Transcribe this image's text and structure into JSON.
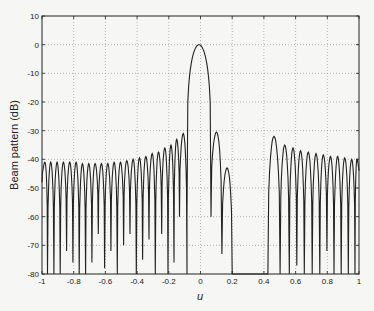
{
  "chart_data": {
    "type": "line",
    "title": "",
    "xlabel": "u",
    "ylabel": "Beam pattern (dB)",
    "xlim": [
      -1,
      1
    ],
    "ylim": [
      -80,
      10
    ],
    "grid": true,
    "legend": null,
    "x_ticks": [
      "-1",
      "-0.8",
      "-0.6",
      "-0.4",
      "-0.2",
      "0",
      "0.2",
      "0.4",
      "0.6",
      "0.8",
      "1"
    ],
    "y_ticks": [
      "10",
      "0",
      "-10",
      "-20",
      "-30",
      "-40",
      "-50",
      "-60",
      "-70",
      "-80"
    ],
    "series": [
      {
        "name": "beam pattern",
        "description": "Main lobe peak 0 dB at u=0; left sidelobes from u=-1 to -0.1 with peaks rising from about -41 dB to -31 dB; right near-in sidelobes at u~0.1 (-30 dB) and u~0.17 (-43 dB); deep null region u~0.2 to 0.42; right sidelobes from u~0.42 to 1 with peak about -32 dB at u~0.47 decaying to about -40 dB",
        "main_lobe": {
          "u": 0,
          "db": 0,
          "null_left": -0.085,
          "null_right": 0.066
        },
        "left_sidelobe_peaks": [
          {
            "u": -0.985,
            "db": -41
          },
          {
            "u": -0.945,
            "db": -41
          },
          {
            "u": -0.905,
            "db": -41
          },
          {
            "u": -0.865,
            "db": -41
          },
          {
            "u": -0.825,
            "db": -41
          },
          {
            "u": -0.785,
            "db": -41
          },
          {
            "u": -0.745,
            "db": -41.5
          },
          {
            "u": -0.705,
            "db": -41.5
          },
          {
            "u": -0.665,
            "db": -41.5
          },
          {
            "u": -0.625,
            "db": -41.5
          },
          {
            "u": -0.585,
            "db": -41.5
          },
          {
            "u": -0.545,
            "db": -41
          },
          {
            "u": -0.505,
            "db": -41
          },
          {
            "u": -0.465,
            "db": -40.5
          },
          {
            "u": -0.425,
            "db": -40
          },
          {
            "u": -0.385,
            "db": -39.5
          },
          {
            "u": -0.345,
            "db": -39
          },
          {
            "u": -0.305,
            "db": -38
          },
          {
            "u": -0.265,
            "db": -37.5
          },
          {
            "u": -0.225,
            "db": -36
          },
          {
            "u": -0.185,
            "db": -35
          },
          {
            "u": -0.15,
            "db": -33
          },
          {
            "u": -0.115,
            "db": -31
          }
        ],
        "right_sidelobe_peaks": [
          {
            "u": 0.1,
            "db": -30.5
          },
          {
            "u": 0.165,
            "db": -43
          },
          {
            "u": 0.47,
            "db": -32
          },
          {
            "u": 0.535,
            "db": -35
          },
          {
            "u": 0.585,
            "db": -36
          },
          {
            "u": 0.63,
            "db": -37
          },
          {
            "u": 0.68,
            "db": -37.5
          },
          {
            "u": 0.73,
            "db": -38
          },
          {
            "u": 0.775,
            "db": -38.5
          },
          {
            "u": 0.82,
            "db": -39
          },
          {
            "u": 0.865,
            "db": -39
          },
          {
            "u": 0.91,
            "db": -39.5
          },
          {
            "u": 0.955,
            "db": -40
          },
          {
            "u": 0.995,
            "db": -40
          }
        ]
      }
    ]
  }
}
